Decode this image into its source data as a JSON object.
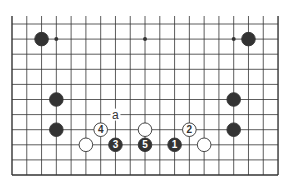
{
  "diagram": {
    "grid": {
      "columns": 19,
      "rows": 11,
      "origin_x": 12,
      "origin_y": 24,
      "spacing_x": 14.78,
      "spacing_y": 15.1,
      "top_open": true,
      "line_color": "#333333"
    },
    "hoshi": [
      {
        "col": 3,
        "row": 1
      },
      {
        "col": 9,
        "row": 1
      },
      {
        "col": 15,
        "row": 1
      }
    ],
    "stones": [
      {
        "color": "black",
        "col": 2,
        "row": 1,
        "label": ""
      },
      {
        "color": "black",
        "col": 16,
        "row": 1,
        "label": ""
      },
      {
        "color": "black",
        "col": 3,
        "row": 5,
        "label": ""
      },
      {
        "color": "black",
        "col": 3,
        "row": 7,
        "label": ""
      },
      {
        "color": "black",
        "col": 15,
        "row": 5,
        "label": ""
      },
      {
        "color": "black",
        "col": 15,
        "row": 7,
        "label": ""
      },
      {
        "color": "white",
        "col": 6,
        "row": 7,
        "label": "4"
      },
      {
        "color": "white",
        "col": 9,
        "row": 7,
        "label": ""
      },
      {
        "color": "white",
        "col": 12,
        "row": 7,
        "label": "2"
      },
      {
        "color": "white",
        "col": 5,
        "row": 8,
        "label": ""
      },
      {
        "color": "black",
        "col": 7,
        "row": 8,
        "label": "3"
      },
      {
        "color": "black",
        "col": 9,
        "row": 8,
        "label": "5"
      },
      {
        "color": "black",
        "col": 11,
        "row": 8,
        "label": "1"
      },
      {
        "color": "white",
        "col": 13,
        "row": 8,
        "label": ""
      }
    ],
    "markers": [
      {
        "col": 7,
        "row": 6,
        "text": "a"
      }
    ],
    "colors": {
      "black_stone": "#333333",
      "white_stone": "#ffffff",
      "stone_outline": "#333333",
      "background": "#ffffff"
    }
  }
}
